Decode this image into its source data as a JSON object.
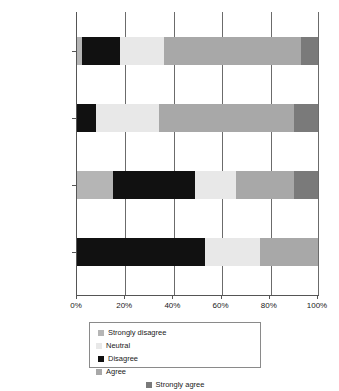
{
  "chart_data": {
    "type": "bar",
    "orientation": "horizontal",
    "stacked": true,
    "normalized": true,
    "title": "",
    "xlabel": "",
    "ylabel": "",
    "xlim": [
      0,
      100
    ],
    "xticks": [
      "0%",
      "20%",
      "40%",
      "60%",
      "80%",
      "100%"
    ],
    "xtick_values": [
      0,
      20,
      40,
      60,
      80,
      100
    ],
    "grid": true,
    "legend_position": "bottom",
    "categories": [
      "Chiro.",
      "Med. Rad.",
      "Educ. (Lit.)",
      "Educ. (Vis. Art)"
    ],
    "series": [
      {
        "name": "Strongly disagree",
        "color": "#b5b5b5",
        "values": [
          2,
          0,
          15,
          0
        ]
      },
      {
        "name": "Disagree",
        "color": "#111111",
        "values": [
          16,
          8,
          34,
          53
        ]
      },
      {
        "name": "Neutral",
        "color": "#e8e8e8",
        "values": [
          18,
          26,
          17,
          23
        ]
      },
      {
        "name": "Agree",
        "color": "#a8a8a8",
        "values": [
          57,
          56,
          24,
          24
        ]
      },
      {
        "name": "Strongly agree",
        "color": "#7a7a7a",
        "values": [
          7,
          10,
          10,
          0
        ]
      }
    ]
  },
  "legend": {
    "entries": [
      {
        "label": "Strongly disagree",
        "color": "#b5b5b5"
      },
      {
        "label": "Neutral",
        "color": "#e8e8e8"
      },
      {
        "label": "Disagree",
        "color": "#111111"
      },
      {
        "label": "Agree",
        "color": "#a8a8a8"
      },
      {
        "label": "Strongly agree",
        "color": "#7a7a7a"
      }
    ]
  }
}
